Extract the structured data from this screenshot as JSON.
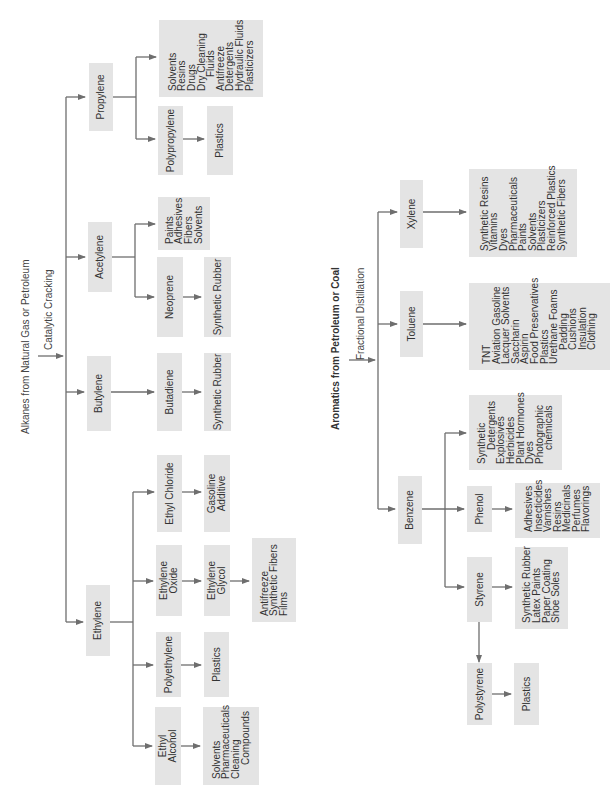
{
  "left_diagram": {
    "title": "Alkanes from Natural Gas or Petroleum",
    "process": "Catalytic Cracking",
    "nodes": {
      "propylene": "Propylene",
      "propylene_uses": [
        "Solvents",
        "Resins",
        "Drugs",
        "Dry Cleaning",
        "Fluids",
        "Antifreeze",
        "Detergents",
        "Hydraulic Fluids",
        "Plasticizers"
      ],
      "polypropylene": "Polypropylene",
      "polypropylene_use": "Plastics",
      "acetylene": "Acetylene",
      "acetylene_uses": [
        "Paints",
        "Adhesives",
        "Fibers",
        "Solvents"
      ],
      "neoprene": "Neoprene",
      "neoprene_use": "Synthetic Rubber",
      "butylene": "Butylene",
      "butadiene": "Butadiene",
      "butadiene_use": "Synthetic Rubber",
      "ethylene": "Ethylene",
      "ethyl_chloride": "Ethyl Chloride",
      "ethyl_chloride_use": "Gasoline Additive",
      "ethylene_oxide": [
        "Ethylene",
        "Oxide"
      ],
      "ethylene_glycol": [
        "Ethylene",
        "Glycol"
      ],
      "ethylene_glycol_uses": [
        "Antifreeze",
        "Synthetic Fibers",
        "Films"
      ],
      "polyethylene": "Polyethylene",
      "polyethylene_use": "Plastics",
      "ethyl_alcohol": [
        "Ethyl",
        "Alcohol"
      ],
      "ethyl_alcohol_uses": [
        "Solvents",
        "Pharmaceuticals",
        "Cleaning",
        "Compounds"
      ]
    }
  },
  "right_diagram": {
    "title": "Aromatics from Petroleum or Coal",
    "process": "Fractional Distillation",
    "nodes": {
      "xylene": "Xylene",
      "xylene_uses": [
        "Synthetic Resins",
        "Vitamins",
        "Dyes",
        "Pharmaceuticals",
        "Paints",
        "Solvents",
        "Plasticizers",
        "Reinforced Plastics",
        "Synthetic Fibers"
      ],
      "toluene": "Toluene",
      "toluene_uses": [
        "TNT",
        "Aviation Gasoline",
        "Lacquer Solvents",
        "Saccharin",
        "Aspirin",
        "Food Preservatives",
        "Plastics",
        "Urethane Foams",
        "Padding",
        "Cushions",
        "Insulation",
        "Clothing"
      ],
      "benzene": "Benzene",
      "benzene_uses": [
        "Synthetic",
        "Detergents",
        "Explosives",
        "Herbicides",
        "Plant Hormones",
        "Dyes",
        "Photographic",
        "chemicals"
      ],
      "phenol": "Phenol",
      "phenol_uses": [
        "Adhesives",
        "Insecticides",
        "Varnishes",
        "Resins",
        "Medicinals",
        "Perfumes",
        "Flavorings"
      ],
      "styrene": "Styrene",
      "styrene_uses": [
        "Synthetic Rubber",
        "Latex Paints",
        "Paper Coating",
        "Shoe Soles"
      ],
      "polystyrene": "Polystyrene",
      "polystyrene_use": "Plastics"
    }
  },
  "colors": {
    "box": "#e4e4e4",
    "line": "#6e6e6e",
    "text": "#333333"
  }
}
